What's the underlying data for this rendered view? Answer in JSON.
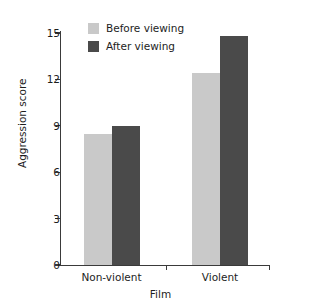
{
  "chart_data": {
    "type": "bar",
    "title": "",
    "xlabel": "Film",
    "ylabel": "Aggression score",
    "categories": [
      "Non-violent",
      "Violent"
    ],
    "series": [
      {
        "name": "Before viewing",
        "color": "#c9c9c9",
        "values": [
          8.5,
          12.4
        ]
      },
      {
        "name": "After viewing",
        "color": "#4a4a4a",
        "values": [
          9.0,
          14.8
        ]
      }
    ],
    "ylim": [
      0,
      15
    ],
    "yticks": [
      0,
      3,
      6,
      9,
      12,
      15
    ],
    "ytick_labels": [
      "0",
      "3",
      "6",
      "9",
      "12",
      "15"
    ],
    "grid": false,
    "legend_position": "top-left"
  },
  "legend": {
    "items": [
      {
        "label": "Before viewing"
      },
      {
        "label": "After viewing"
      }
    ]
  },
  "axes": {
    "x_title": "Film",
    "y_title": "Aggression score"
  }
}
